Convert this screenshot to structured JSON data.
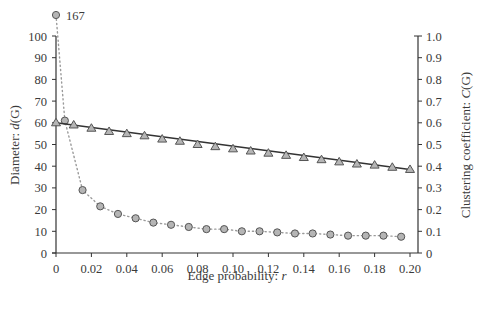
{
  "chart_data": {
    "type": "line",
    "title": "",
    "xlabel": "Edge probability: r",
    "xlabel_parts": {
      "text": "Edge probability: ",
      "var": "r"
    },
    "ylabel_left": "Diameter: d(G)",
    "ylabel_left_parts": {
      "text": "Diameter: ",
      "var": "d",
      "paren": "(G)"
    },
    "ylabel_right": "Clustering coefficient: C(G)",
    "ylabel_right_parts": {
      "text": "Clustering coefficient: ",
      "var": "C",
      "paren": "(G)"
    },
    "xlim": [
      0,
      0.2
    ],
    "ylim_left": [
      0,
      100
    ],
    "ylim_right": [
      0,
      1.0
    ],
    "x_ticks": [
      "0",
      "0.02",
      "0.04",
      "0.06",
      "0.08",
      "0.10",
      "0.12",
      "0.14",
      "0.16",
      "0.18",
      "0.20"
    ],
    "y_left_ticks": [
      "0",
      "10",
      "20",
      "30",
      "40",
      "50",
      "60",
      "70",
      "80",
      "90",
      "100"
    ],
    "y_right_ticks": [
      "0",
      "0.1",
      "0.2",
      "0.3",
      "0.4",
      "0.5",
      "0.6",
      "0.7",
      "0.8",
      "0.9",
      "1.0"
    ],
    "grid": false,
    "legend": null,
    "annotations": [
      {
        "text": "167",
        "x": 0.0,
        "y": 167,
        "note": "off-scale point above axis"
      }
    ],
    "series": [
      {
        "name": "Diameter d(G)",
        "axis": "left",
        "marker": "circle",
        "line_style": "dotted",
        "x": [
          0.0,
          0.005,
          0.015,
          0.025,
          0.035,
          0.045,
          0.055,
          0.065,
          0.075,
          0.085,
          0.095,
          0.105,
          0.115,
          0.125,
          0.135,
          0.145,
          0.155,
          0.165,
          0.175,
          0.185,
          0.195
        ],
        "values": [
          167,
          61,
          29,
          21.5,
          18,
          16,
          14,
          13,
          12,
          11,
          11,
          10,
          10,
          9.5,
          9,
          9,
          8.5,
          8,
          8,
          8,
          7.5
        ]
      },
      {
        "name": "Clustering coefficient C(G)",
        "axis": "right",
        "marker": "triangle",
        "line_style": "solid",
        "x": [
          0.0,
          0.01,
          0.02,
          0.03,
          0.04,
          0.05,
          0.06,
          0.07,
          0.08,
          0.09,
          0.1,
          0.11,
          0.12,
          0.13,
          0.14,
          0.15,
          0.16,
          0.17,
          0.18,
          0.19,
          0.2
        ],
        "values": [
          0.6,
          0.59,
          0.575,
          0.56,
          0.55,
          0.54,
          0.525,
          0.515,
          0.5,
          0.49,
          0.48,
          0.47,
          0.46,
          0.45,
          0.44,
          0.43,
          0.42,
          0.41,
          0.405,
          0.395,
          0.385
        ]
      }
    ]
  },
  "colors": {
    "axis": "#333333",
    "marker_fill": "#b5b5b5",
    "marker_stroke": "#555555",
    "trend_line": "#333333",
    "dotted_line": "#9a9a9a"
  }
}
